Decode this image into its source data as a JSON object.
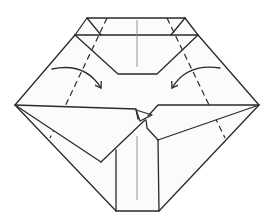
{
  "diagram": {
    "type": "origami-fold-step",
    "colors": {
      "line": "#2a2a2a",
      "crease": "#8a8a8a",
      "paper": "#fbfbfb",
      "background": "#ffffff"
    },
    "outline": [
      [
        87,
        18
      ],
      [
        185,
        18
      ],
      [
        198,
        35
      ],
      [
        259,
        105
      ],
      [
        159,
        211
      ],
      [
        116,
        211
      ],
      [
        15,
        105
      ],
      [
        75,
        35
      ]
    ],
    "top_band": {
      "top": [
        [
          87,
          18
        ],
        [
          185,
          18
        ]
      ],
      "bottom": [
        [
          75,
          35
        ],
        [
          198,
          35
        ]
      ]
    },
    "inner_pocket": [
      [
        75,
        35
      ],
      [
        118,
        74
      ],
      [
        157,
        74
      ],
      [
        198,
        35
      ]
    ],
    "center_crease_top": [
      [
        137,
        20
      ],
      [
        137,
        67
      ]
    ],
    "valley_folds": [
      {
        "name": "left-valley-fold",
        "from": [
          107,
          18
        ],
        "to": [
          50,
          138
        ]
      },
      {
        "name": "right-valley-fold",
        "from": [
          167,
          18
        ],
        "to": [
          225,
          138
        ]
      }
    ],
    "arrows": [
      {
        "name": "left-fold-arrow",
        "from": [
          52,
          69
        ],
        "to": [
          101,
          88
        ],
        "direction": "inward-right"
      },
      {
        "name": "right-fold-arrow",
        "from": [
          220,
          68
        ],
        "to": [
          172,
          88
        ],
        "direction": "inward-left"
      }
    ],
    "flaps": {
      "left": [
        [
          15,
          105
        ],
        [
          136,
          109
        ],
        [
          138,
          119
        ],
        [
          101,
          162
        ]
      ],
      "right": [
        [
          259,
          105
        ],
        [
          158,
          105
        ],
        [
          147,
          122
        ],
        [
          158,
          140
        ]
      ]
    },
    "bottom_panel": {
      "left": 116,
      "right": 159,
      "top": 140,
      "bottom": 211
    },
    "center_crease_bottom": [
      [
        137,
        136
      ],
      [
        137,
        200
      ]
    ]
  }
}
